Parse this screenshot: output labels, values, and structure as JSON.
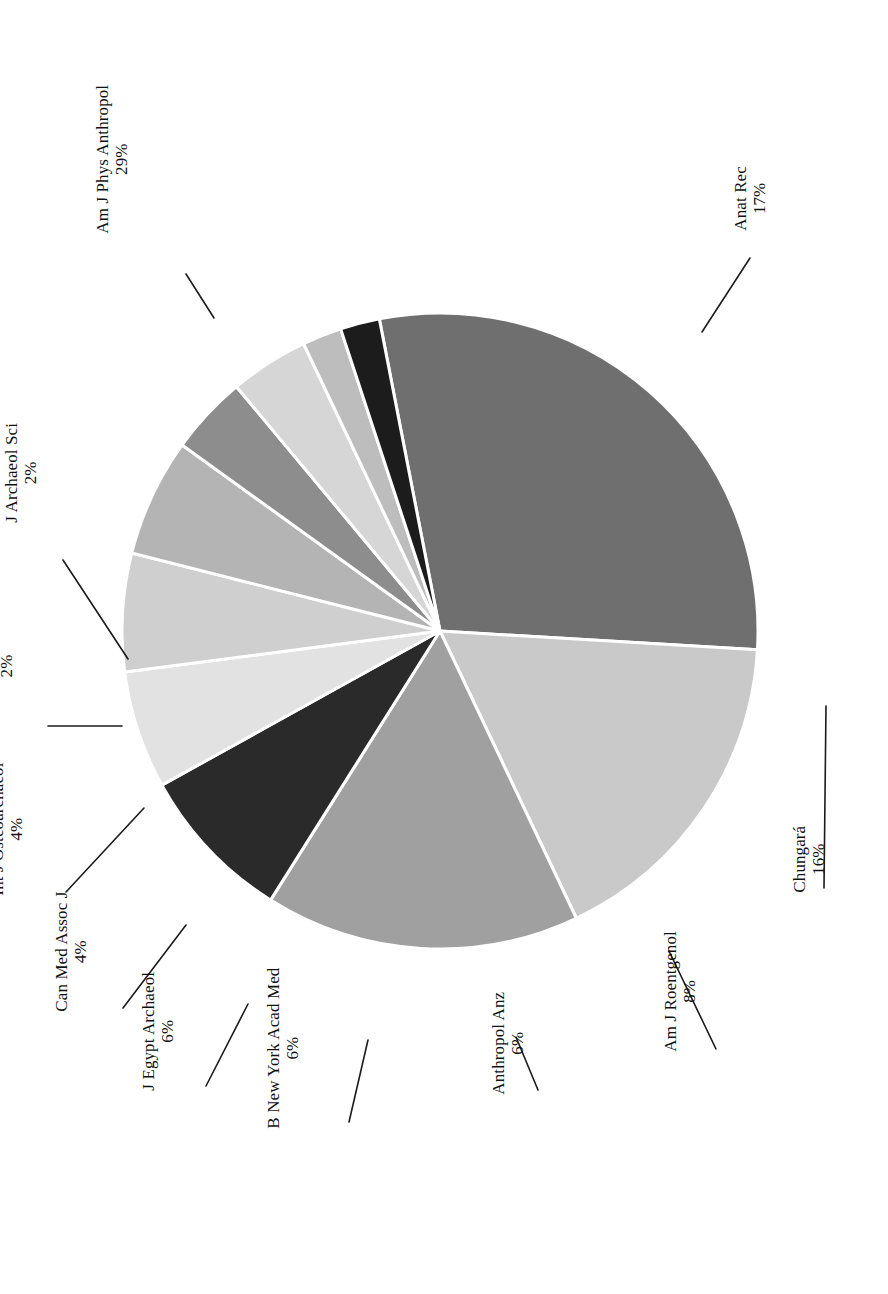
{
  "figure": {
    "orientation": "rotated-90-ccw",
    "background_color": "#ffffff",
    "label_text_color": "#111111",
    "slice_border_color": "#ffffff"
  },
  "chart_data": {
    "type": "pie",
    "title": "",
    "subtitle": "",
    "xlabel": "",
    "ylabel": "",
    "legend_position": "none",
    "grid": false,
    "value_suffix": "%",
    "start_angle_deg": -101,
    "direction": "clockwise",
    "center": {
      "x": 440,
      "y": 631
    },
    "radius": 318,
    "categories": [
      "Am J Phys Anthropol",
      "Anat Rec",
      "Chungará",
      "Am J Roentgenol",
      "Anthropol Anz",
      "B New York Acad Med",
      "J Egypt Archaeol",
      "Can Med Assoc J",
      "Int J Osteoarchaeol",
      "Forensic Sci Int",
      "J Archaeol Sci"
    ],
    "values": [
      29,
      17,
      16,
      8,
      6,
      6,
      6,
      4,
      4,
      2,
      2
    ],
    "labels": [
      "29%",
      "17%",
      "16%",
      "8%",
      "6%",
      "6%",
      "6%",
      "4%",
      "4%",
      "2%",
      "2%"
    ],
    "colors": [
      "#6f6f6f",
      "#c9c9c9",
      "#a0a0a0",
      "#2a2a2a",
      "#e2e2e2",
      "#cfcfcf",
      "#b4b4b4",
      "#8d8d8d",
      "#d6d6d6",
      "#bdbdbd",
      "#1c1c1c"
    ],
    "slices": [
      {
        "name": "Am J Phys Anthropol",
        "value": 29,
        "label": "29%",
        "color": "#6f6f6f",
        "label_pos": {
          "x": 167,
          "y": 253
        },
        "leader": [
          {
            "x": 186,
            "y": 274
          },
          {
            "x": 214,
            "y": 318
          }
        ]
      },
      {
        "name": "Anat Rec",
        "value": 17,
        "label": "17%",
        "color": "#c9c9c9",
        "label_pos": {
          "x": 763,
          "y": 250
        },
        "leader": [
          {
            "x": 750,
            "y": 258
          },
          {
            "x": 702,
            "y": 332
          }
        ]
      },
      {
        "name": "Chungará",
        "value": 16,
        "label": "16%",
        "color": "#a0a0a0",
        "label_pos": {
          "x": 823,
          "y": 912
        },
        "leader": [
          {
            "x": 824,
            "y": 888
          },
          {
            "x": 826,
            "y": 706
          }
        ]
      },
      {
        "name": "Am J Roentgenol",
        "value": 8,
        "label": "8%",
        "color": "#2a2a2a",
        "label_pos": {
          "x": 721,
          "y": 1071
        },
        "leader": [
          {
            "x": 716,
            "y": 1049
          },
          {
            "x": 669,
            "y": 951
          }
        ]
      },
      {
        "name": "Anthropol Anz",
        "value": 6,
        "label": "6%",
        "color": "#e2e2e2",
        "label_pos": {
          "x": 540,
          "y": 1114
        },
        "leader": [
          {
            "x": 538,
            "y": 1090
          },
          {
            "x": 516,
            "y": 1037
          }
        ]
      },
      {
        "name": "B New York Acad Med",
        "value": 6,
        "label": "6%",
        "color": "#cfcfcf",
        "label_pos": {
          "x": 345,
          "y": 1148
        },
        "leader": [
          {
            "x": 349,
            "y": 1122
          },
          {
            "x": 368,
            "y": 1040
          }
        ]
      },
      {
        "name": "J Egypt Archaeol",
        "value": 6,
        "label": "6%",
        "color": "#b4b4b4",
        "label_pos": {
          "x": 198,
          "y": 1110
        },
        "leader": [
          {
            "x": 206,
            "y": 1086
          },
          {
            "x": 248,
            "y": 1004
          }
        ]
      },
      {
        "name": "Can Med Assoc J",
        "value": 4,
        "label": "4%",
        "color": "#8d8d8d",
        "label_pos": {
          "x": 112,
          "y": 1031
        },
        "leader": [
          {
            "x": 123,
            "y": 1008
          },
          {
            "x": 186,
            "y": 925
          }
        ]
      },
      {
        "name": "Int J Osteoarchaeol",
        "value": 4,
        "label": "4%",
        "color": "#d6d6d6",
        "label_pos": {
          "x": 55,
          "y": 915
        },
        "leader": [
          {
            "x": 66,
            "y": 892
          },
          {
            "x": 144,
            "y": 808
          }
        ]
      },
      {
        "name": "Forensic Sci Int",
        "value": 2,
        "label": "2%",
        "color": "#bdbdbd",
        "label_pos": {
          "x": 33,
          "y": 740
        },
        "leader": [
          {
            "x": 48,
            "y": 726
          },
          {
            "x": 122,
            "y": 726
          }
        ]
      },
      {
        "name": "J Archaeol Sci",
        "value": 2,
        "label": "2%",
        "color": "#1c1c1c",
        "label_pos": {
          "x": 52,
          "y": 542
        },
        "leader": [
          {
            "x": 63,
            "y": 560
          },
          {
            "x": 128,
            "y": 659
          }
        ]
      }
    ]
  }
}
